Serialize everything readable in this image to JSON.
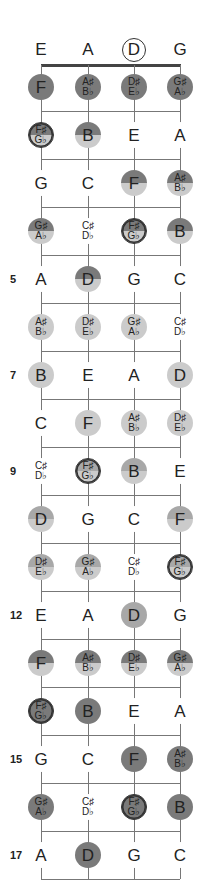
{
  "strings": [
    {
      "name": "E",
      "x": 41
    },
    {
      "name": "A",
      "x": 88
    },
    {
      "name": "D",
      "x": 134,
      "open_circled": true
    },
    {
      "name": "G",
      "x": 180
    }
  ],
  "fret_markers": [
    {
      "fret": 5,
      "label": "5"
    },
    {
      "fret": 7,
      "label": "7"
    },
    {
      "fret": 9,
      "label": "9"
    },
    {
      "fret": 12,
      "label": "12"
    },
    {
      "fret": 15,
      "label": "15"
    },
    {
      "fret": 17,
      "label": "17"
    }
  ],
  "frets": [
    {
      "fret": 1,
      "notes": [
        {
          "t": "F",
          "s": "dark"
        },
        {
          "t": "A♯|B♭",
          "s": "dark"
        },
        {
          "t": "D♯|E♭",
          "s": "dark"
        },
        {
          "t": "G♯|A♭",
          "s": "dark"
        }
      ]
    },
    {
      "fret": 2,
      "notes": [
        {
          "t": "F♯|G♭",
          "s": "split ring"
        },
        {
          "t": "B",
          "s": "split"
        },
        {
          "t": "E",
          "s": "plain"
        },
        {
          "t": "A",
          "s": "plain"
        }
      ]
    },
    {
      "fret": 3,
      "notes": [
        {
          "t": "G",
          "s": "plain"
        },
        {
          "t": "C",
          "s": "plain"
        },
        {
          "t": "F",
          "s": "split"
        },
        {
          "t": "A♯|B♭",
          "s": "split"
        }
      ]
    },
    {
      "fret": 4,
      "notes": [
        {
          "t": "G♯|A♭",
          "s": "split"
        },
        {
          "t": "C♯|D♭",
          "s": "plain"
        },
        {
          "t": "F♯|G♭",
          "s": "split ring"
        },
        {
          "t": "B",
          "s": "split"
        }
      ]
    },
    {
      "fret": 5,
      "notes": [
        {
          "t": "A",
          "s": "plain"
        },
        {
          "t": "D",
          "s": "split"
        },
        {
          "t": "G",
          "s": "plain"
        },
        {
          "t": "C",
          "s": "plain"
        }
      ]
    },
    {
      "fret": 6,
      "notes": [
        {
          "t": "A♯|B♭",
          "s": "light"
        },
        {
          "t": "D♯|E♭",
          "s": "light"
        },
        {
          "t": "G♯|A♭",
          "s": "light"
        },
        {
          "t": "C♯|D♭",
          "s": "plain"
        }
      ]
    },
    {
      "fret": 7,
      "notes": [
        {
          "t": "B",
          "s": "light"
        },
        {
          "t": "E",
          "s": "plain"
        },
        {
          "t": "A",
          "s": "plain"
        },
        {
          "t": "D",
          "s": "light"
        }
      ]
    },
    {
      "fret": 8,
      "notes": [
        {
          "t": "C",
          "s": "plain"
        },
        {
          "t": "F",
          "s": "light"
        },
        {
          "t": "A♯|B♭",
          "s": "light"
        },
        {
          "t": "D♯|E♭",
          "s": "light"
        }
      ]
    },
    {
      "fret": 9,
      "notes": [
        {
          "t": "C♯|D♭",
          "s": "plain"
        },
        {
          "t": "F♯|G♭",
          "s": "splitm ring"
        },
        {
          "t": "B",
          "s": "splitm"
        },
        {
          "t": "E",
          "s": "plain"
        }
      ]
    },
    {
      "fret": 10,
      "notes": [
        {
          "t": "D",
          "s": "splitm"
        },
        {
          "t": "G",
          "s": "plain"
        },
        {
          "t": "C",
          "s": "plain"
        },
        {
          "t": "F",
          "s": "splitm"
        }
      ]
    },
    {
      "fret": 11,
      "notes": [
        {
          "t": "D♯|E♭",
          "s": "splitm"
        },
        {
          "t": "G♯|A♭",
          "s": "splitm"
        },
        {
          "t": "C♯|D♭",
          "s": "plain"
        },
        {
          "t": "F♯|G♭",
          "s": "splitm ring"
        }
      ]
    },
    {
      "fret": 12,
      "notes": [
        {
          "t": "E",
          "s": "plain"
        },
        {
          "t": "A",
          "s": "plain"
        },
        {
          "t": "D",
          "s": "mid"
        },
        {
          "t": "G",
          "s": "plain"
        }
      ]
    },
    {
      "fret": 13,
      "notes": [
        {
          "t": "F",
          "s": "split"
        },
        {
          "t": "A♯|B♭",
          "s": "split"
        },
        {
          "t": "D♯|E♭",
          "s": "split"
        },
        {
          "t": "G♯|A♭",
          "s": "split"
        }
      ]
    },
    {
      "fret": 14,
      "notes": [
        {
          "t": "F♯|G♭",
          "s": "dark ring"
        },
        {
          "t": "B",
          "s": "dark"
        },
        {
          "t": "E",
          "s": "plain"
        },
        {
          "t": "A",
          "s": "plain"
        }
      ]
    },
    {
      "fret": 15,
      "notes": [
        {
          "t": "G",
          "s": "plain"
        },
        {
          "t": "C",
          "s": "plain"
        },
        {
          "t": "F",
          "s": "dark"
        },
        {
          "t": "A♯|B♭",
          "s": "dark"
        }
      ]
    },
    {
      "fret": 16,
      "notes": [
        {
          "t": "G♯|A♭",
          "s": "dark"
        },
        {
          "t": "C♯|D♭",
          "s": "plain"
        },
        {
          "t": "F♯|G♭",
          "s": "dark ring"
        },
        {
          "t": "B",
          "s": "dark"
        }
      ]
    },
    {
      "fret": 17,
      "notes": [
        {
          "t": "A",
          "s": "plain"
        },
        {
          "t": "D",
          "s": "dark"
        },
        {
          "t": "G",
          "s": "plain"
        },
        {
          "t": "C",
          "s": "plain"
        }
      ]
    }
  ],
  "colors": {
    "dark": "#7a7a7a",
    "mid": "#a8a8a8",
    "light": "#cbcbcb",
    "line": "#777777",
    "nut": "#444444"
  }
}
